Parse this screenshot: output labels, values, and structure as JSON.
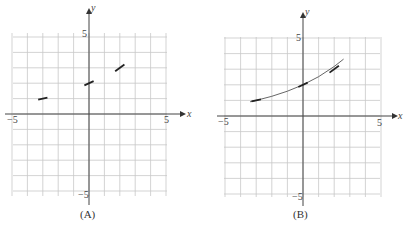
{
  "chart_data": [
    {
      "type": "line",
      "title": "(A)",
      "xlabel": "x",
      "ylabel": "y",
      "xlim": [
        -5,
        5
      ],
      "ylim": [
        -5,
        5
      ],
      "grid": true,
      "xticks_labeled": [
        -5,
        5
      ],
      "yticks_labeled": [
        5,
        -5
      ],
      "segments": [
        {
          "x": [
            -3.2,
            -2.8
          ],
          "y": [
            0.95,
            1.05
          ],
          "center": [
            -3,
            1
          ]
        },
        {
          "x": [
            -0.2,
            0.2
          ],
          "y": [
            1.9,
            2.1
          ],
          "center": [
            0,
            2
          ]
        },
        {
          "x": [
            1.8,
            2.2
          ],
          "y": [
            2.85,
            3.15
          ],
          "center": [
            2,
            3
          ]
        }
      ]
    },
    {
      "type": "line",
      "title": "(B)",
      "xlabel": "x",
      "ylabel": "y",
      "xlim": [
        -5,
        5
      ],
      "ylim": [
        -5,
        5
      ],
      "grid": true,
      "xticks_labeled": [
        -5,
        5
      ],
      "yticks_labeled": [
        5,
        -5
      ],
      "curve": {
        "x": [
          -3.4,
          -3,
          -2,
          -1,
          0,
          1,
          2,
          2.6
        ],
        "y": [
          0.91,
          1.0,
          1.26,
          1.59,
          2.0,
          2.52,
          3.17,
          3.65
        ]
      },
      "segments": [
        {
          "center": [
            -3,
            1
          ]
        },
        {
          "center": [
            0,
            2
          ]
        },
        {
          "center": [
            2,
            3
          ]
        }
      ]
    }
  ],
  "graphs": [
    {
      "caption": "(A)",
      "x_axis": "x",
      "y_axis": "y",
      "xmin_label": "−5",
      "xmax_label": "5",
      "ymax_label": "5",
      "ymin_label": "−5"
    },
    {
      "caption": "(B)",
      "x_axis": "x",
      "y_axis": "y",
      "xmin_label": "−5",
      "xmax_label": "5",
      "ymax_label": "5",
      "ymin_label": "−5"
    }
  ]
}
